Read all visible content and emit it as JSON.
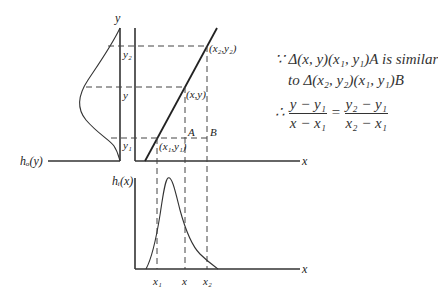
{
  "diagram": {
    "top_axis_label_y": "y",
    "left_axis_label": "hₒ(y)",
    "top_right_x_label": "x",
    "bottom_axis_label_h": "hᵢ(x)",
    "bottom_x_label": "x",
    "y_ticks": {
      "y2": "y₂",
      "y": "y",
      "y1": "y₁"
    },
    "x_ticks": {
      "x1": "x₁",
      "x": "x",
      "x2": "x₂"
    },
    "points": {
      "p2": "(x₂,y₂)",
      "p": "(x,y)",
      "p1": "(x₁,y₁)",
      "A": "A",
      "B": "B"
    }
  },
  "equation": {
    "line1": "∵ Δ(x, y)(x₁, y₁)A  is similar",
    "line2": "to   Δ(x₂, y₂)(x₁, y₁)B",
    "therefore": "∴",
    "lhs_num": "y − y₁",
    "lhs_den": "x − x₁",
    "equals": "=",
    "rhs_num": "y₂ − y₁",
    "rhs_den": "x₂ − x₁"
  },
  "colors": {
    "line": "#333333",
    "dash": "#444444"
  }
}
